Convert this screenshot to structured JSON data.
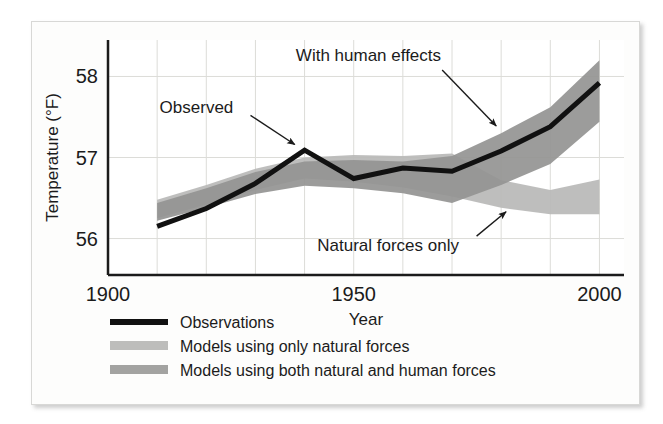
{
  "figure": {
    "card_background": "#fdfdfc",
    "border_color": "#d8d8d6"
  },
  "chart_data": {
    "type": "area",
    "title": "",
    "xlabel": "Year",
    "ylabel": "Temperature (°F)",
    "xlim": [
      1900,
      2005
    ],
    "ylim": [
      55.55,
      58.45
    ],
    "xticks": [
      1900,
      1950,
      2000
    ],
    "xtick_labels": [
      "1900",
      "1950",
      "2000"
    ],
    "yticks": [
      56,
      57,
      58
    ],
    "ytick_labels": [
      "56",
      "57",
      "58"
    ],
    "grid": true,
    "grid_color": "#dcdcd8",
    "x_minor_step": 10,
    "legend_position": "below-axes",
    "x": [
      1910,
      1920,
      1930,
      1940,
      1950,
      1960,
      1970,
      1980,
      1990,
      2000
    ],
    "series": [
      {
        "name": "Observations",
        "key": "observations",
        "type": "line",
        "color": "#111111",
        "linewidth": 5,
        "values": [
          56.15,
          56.37,
          56.68,
          57.09,
          56.74,
          56.87,
          56.83,
          57.08,
          57.38,
          57.92
        ]
      },
      {
        "name": "Models using only natural forces",
        "key": "natural_only",
        "type": "band",
        "color": "#b9b9b7",
        "lower": [
          56.25,
          56.42,
          56.6,
          56.74,
          56.7,
          56.63,
          56.52,
          56.38,
          56.3,
          56.3
        ],
        "upper": [
          56.48,
          56.66,
          56.86,
          57.0,
          57.03,
          57.02,
          57.05,
          56.72,
          56.6,
          56.73
        ]
      },
      {
        "name": "Models using both natural and human forces",
        "key": "natural_and_human",
        "type": "band",
        "color": "#949492",
        "lower": [
          56.22,
          56.38,
          56.55,
          56.65,
          56.62,
          56.56,
          56.44,
          56.66,
          56.92,
          57.44
        ],
        "upper": [
          56.44,
          56.62,
          56.82,
          56.95,
          56.97,
          56.95,
          57.02,
          57.3,
          57.62,
          58.2
        ]
      }
    ],
    "annotations": [
      {
        "key": "observed",
        "text": "Observed",
        "text_x": 1918,
        "text_y": 57.62,
        "arrow_from_x": 1929,
        "arrow_from_y": 57.52,
        "arrow_to_x": 1938,
        "arrow_to_y": 57.16
      },
      {
        "key": "with_human_effects",
        "text": "With human effects",
        "text_x": 1953,
        "text_y": 58.27,
        "arrow_from_x": 1968,
        "arrow_from_y": 58.08,
        "arrow_to_x": 1979,
        "arrow_to_y": 57.39
      },
      {
        "key": "natural_forces_only",
        "text": "Natural forces only",
        "text_x": 1957,
        "text_y": 55.92,
        "arrow_from_x": 1975,
        "arrow_from_y": 56.03,
        "arrow_to_x": 1981,
        "arrow_to_y": 56.33
      }
    ],
    "legend": [
      {
        "key": "observations",
        "label": "Observations",
        "swatch": "line",
        "color": "#111111"
      },
      {
        "key": "natural_only",
        "label": "Models using only natural forces",
        "swatch": "band",
        "color": "#bdbdbb"
      },
      {
        "key": "natural_and_human",
        "label": "Models using both natural and human forces",
        "swatch": "band",
        "color": "#a3a3a1"
      }
    ]
  }
}
